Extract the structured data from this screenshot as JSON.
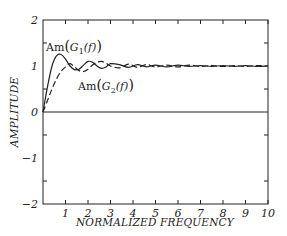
{
  "chart_data": {
    "type": "line",
    "title": "",
    "xlabel": "NORMALIZED FREQUENCY",
    "ylabel": "AMPLITUDE",
    "xlim": [
      0,
      10
    ],
    "ylim": [
      -2,
      2
    ],
    "grid": false,
    "x_ticks": [
      "1",
      "2",
      "3",
      "4",
      "5",
      "6",
      "7",
      "8",
      "9",
      "10"
    ],
    "y_ticks": [
      "2",
      "1",
      "0",
      "-1",
      "-2"
    ],
    "annotations": [
      {
        "text": "Am(G1(f))",
        "near_x": 0.4,
        "near_y": 1.35
      },
      {
        "text": "Am(G2(f))",
        "near_x": 1.2,
        "near_y": 0.55
      }
    ],
    "series": [
      {
        "name": "Am(G1(f))",
        "style": "solid",
        "x": [
          0,
          0.2,
          0.4,
          0.6,
          0.8,
          1.0,
          1.2,
          1.4,
          1.6,
          1.8,
          2.0,
          2.2,
          2.4,
          2.6,
          2.8,
          3.0,
          3.4,
          3.8,
          4.2,
          4.6,
          5.0,
          5.5,
          6.0,
          6.5,
          7.0,
          7.5,
          8.0,
          8.5,
          9.0,
          9.5,
          10.0
        ],
        "values": [
          0,
          0.55,
          1.0,
          1.22,
          1.25,
          1.15,
          1.0,
          0.92,
          0.93,
          1.02,
          1.1,
          1.08,
          1.0,
          0.95,
          0.98,
          1.05,
          1.03,
          0.97,
          1.03,
          0.98,
          1.02,
          0.98,
          1.02,
          0.99,
          1.01,
          0.99,
          1.01,
          0.99,
          1.01,
          0.99,
          1.0
        ]
      },
      {
        "name": "Am(G2(f))",
        "style": "dashed",
        "x": [
          0,
          0.2,
          0.4,
          0.6,
          0.8,
          1.0,
          1.2,
          1.4,
          1.6,
          1.8,
          2.0,
          2.2,
          2.4,
          2.6,
          2.8,
          3.0,
          3.4,
          3.8,
          4.2,
          4.6,
          5.0,
          5.5,
          6.0,
          6.5,
          7.0,
          7.5,
          8.0,
          8.5,
          9.0,
          9.5,
          10.0
        ],
        "values": [
          0,
          0.25,
          0.5,
          0.72,
          0.88,
          0.98,
          1.05,
          0.98,
          0.9,
          0.88,
          0.93,
          1.02,
          1.08,
          1.1,
          1.06,
          1.0,
          0.96,
          1.04,
          0.97,
          1.03,
          0.98,
          1.02,
          0.98,
          1.02,
          0.99,
          1.01,
          0.99,
          1.01,
          0.99,
          1.01,
          1.0
        ]
      }
    ]
  }
}
